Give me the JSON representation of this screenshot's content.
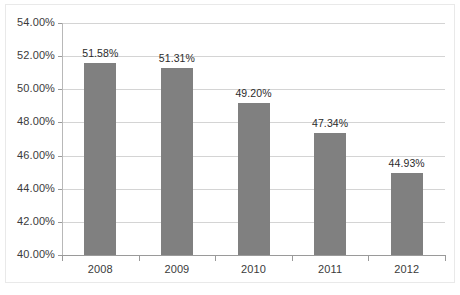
{
  "chart_data": {
    "type": "bar",
    "title": "",
    "subtitle": "",
    "xlabel": "",
    "ylabel": "",
    "categories": [
      "2008",
      "2009",
      "2010",
      "2011",
      "2012"
    ],
    "values": [
      51.58,
      51.31,
      49.2,
      47.34,
      44.93
    ],
    "data_labels": [
      "51.58%",
      "51.31%",
      "49.20%",
      "47.34%",
      "44.93%"
    ],
    "series": [
      {
        "name": "",
        "values": [
          51.58,
          51.31,
          49.2,
          47.34,
          44.93
        ]
      }
    ],
    "ylim": [
      40.0,
      54.0
    ],
    "ytick_values": [
      40.0,
      42.0,
      44.0,
      46.0,
      48.0,
      50.0,
      52.0,
      54.0
    ],
    "ytick_labels": [
      "40.00%",
      "42.00%",
      "44.00%",
      "46.00%",
      "48.00%",
      "50.00%",
      "52.00%",
      "54.00%"
    ],
    "xtick_labels": [
      "2008",
      "2009",
      "2010",
      "2011",
      "2012"
    ],
    "grid": true,
    "grid_axis": "y",
    "legend": false,
    "legend_position": "none",
    "bar_color": "#808080",
    "grid_color": "#d4d4d4",
    "axis_color": "#9a9a9a",
    "background_color": "#ffffff",
    "text_color": "#3b3b3b"
  }
}
